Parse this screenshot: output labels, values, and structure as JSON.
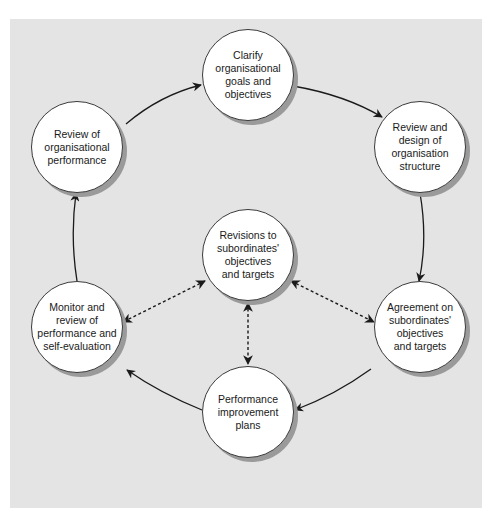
{
  "diagram": {
    "type": "cycle",
    "background_color": "#e4e4e4",
    "node_fill": "#ffffff",
    "nodes": [
      {
        "id": "clarify",
        "label": "Clarify\norganisational\ngoals and\nobjectives",
        "position": "top"
      },
      {
        "id": "review-design",
        "label": "Review and\ndesign of\norganisation\nstructure",
        "position": "upper-right"
      },
      {
        "id": "agreement",
        "label": "Agreement on\nsubordinates'\nobjectives\nand targets",
        "position": "lower-right"
      },
      {
        "id": "performance-plans",
        "label": "Performance\nimprovement\nplans",
        "position": "bottom"
      },
      {
        "id": "monitor",
        "label": "Monitor and\nreview of\nperformance and\nself-evaluation",
        "position": "lower-left"
      },
      {
        "id": "review-org",
        "label": "Review of\norganisational\nperformance",
        "position": "upper-left"
      },
      {
        "id": "revisions",
        "label": "Revisions to\nsubordinates'\nobjectives\nand targets",
        "position": "center"
      }
    ],
    "edges": [
      {
        "from": "clarify",
        "to": "review-design",
        "style": "solid",
        "direction": "forward"
      },
      {
        "from": "review-design",
        "to": "agreement",
        "style": "solid",
        "direction": "forward"
      },
      {
        "from": "agreement",
        "to": "performance-plans",
        "style": "solid",
        "direction": "forward"
      },
      {
        "from": "performance-plans",
        "to": "monitor",
        "style": "solid",
        "direction": "forward"
      },
      {
        "from": "monitor",
        "to": "review-org",
        "style": "solid",
        "direction": "forward"
      },
      {
        "from": "review-org",
        "to": "clarify",
        "style": "solid",
        "direction": "forward"
      },
      {
        "from": "revisions",
        "to": "monitor",
        "style": "dashed",
        "direction": "both"
      },
      {
        "from": "revisions",
        "to": "agreement",
        "style": "dashed",
        "direction": "both"
      },
      {
        "from": "revisions",
        "to": "performance-plans",
        "style": "dashed",
        "direction": "both"
      }
    ]
  }
}
